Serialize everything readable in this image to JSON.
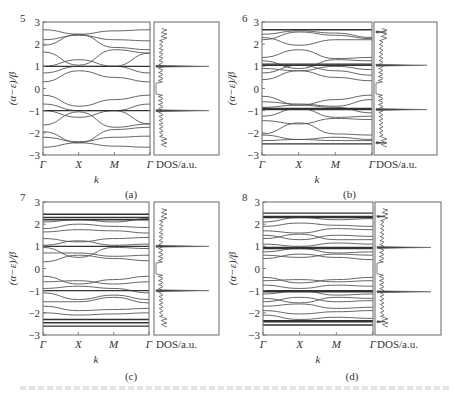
{
  "figure": {
    "panels": [
      {
        "id": "a",
        "number": "5",
        "caption": "(a)"
      },
      {
        "id": "b",
        "number": "6",
        "caption": "(b)"
      },
      {
        "id": "c",
        "number": "7",
        "caption": "(c)"
      },
      {
        "id": "d",
        "number": "8",
        "caption": "(d)"
      }
    ],
    "y_axis_label": "(α−ε)/β",
    "x_axis_label": "k",
    "x_ticks": [
      "Γ",
      "X",
      "M",
      "Γ"
    ],
    "y_ticks": [
      "3",
      "2",
      "1",
      "0",
      "−1",
      "−2",
      "−3"
    ],
    "dos_label": "DOS/a.u."
  },
  "chart_data": [
    {
      "type": "line",
      "title": "(a) N=5 band structure and DOS",
      "xlabel": "k",
      "ylabel": "(α−ε)/β",
      "x_ticks": [
        "Γ",
        "X",
        "M",
        "Γ"
      ],
      "ylim": [
        -3,
        3
      ],
      "flat_bands": [
        1,
        -1
      ],
      "bands_sampled_at_ticks": [
        [
          2.65,
          2.45,
          2.6,
          2.65
        ],
        [
          2.2,
          2.4,
          2.2,
          2.15
        ],
        [
          1.95,
          2.45,
          1.85,
          1.75
        ],
        [
          1.65,
          1.05,
          1.75,
          1.6
        ],
        [
          1.0,
          1.3,
          1.0,
          1.6
        ],
        [
          0.7,
          1.0,
          1.0,
          0.7
        ],
        [
          0.3,
          0.8,
          0.5,
          0.3
        ],
        [
          -0.3,
          -0.8,
          -0.5,
          -0.3
        ],
        [
          -0.7,
          -1.0,
          -1.0,
          -0.7
        ],
        [
          -1.0,
          -1.3,
          -1.0,
          -1.6
        ],
        [
          -1.65,
          -1.05,
          -1.75,
          -1.6
        ],
        [
          -1.95,
          -2.45,
          -1.85,
          -1.75
        ],
        [
          -2.2,
          -2.4,
          -2.2,
          -2.15
        ],
        [
          -2.65,
          -2.45,
          -2.6,
          -2.65
        ]
      ],
      "dos_peaks": [
        {
          "energy": 1.0,
          "height": 1.0
        },
        {
          "energy": -1.0,
          "height": 1.0
        }
      ]
    },
    {
      "type": "line",
      "title": "(b) N=6 band structure and DOS",
      "xlabel": "k",
      "ylabel": "(α−ε)/β",
      "x_ticks": [
        "Γ",
        "X",
        "M",
        "Γ"
      ],
      "ylim": [
        -3,
        3
      ],
      "flat_bands": [
        2.65,
        1.1,
        1.05,
        -0.9,
        -0.95,
        -2.5
      ],
      "bands_sampled_at_ticks": [
        [
          2.45,
          2.6,
          2.5,
          2.3
        ],
        [
          2.2,
          2.55,
          2.4,
          2.25
        ],
        [
          2.3,
          1.95,
          2.2,
          2.2
        ],
        [
          1.4,
          1.75,
          1.35,
          1.4
        ],
        [
          1.25,
          0.9,
          1.3,
          1.25
        ],
        [
          0.9,
          0.8,
          1.0,
          0.85
        ],
        [
          0.7,
          1.05,
          0.8,
          0.6
        ],
        [
          0.4,
          0.8,
          0.5,
          0.35
        ],
        [
          -0.35,
          -0.75,
          -0.5,
          -0.3
        ],
        [
          -0.6,
          -0.7,
          -0.8,
          -0.5
        ],
        [
          -0.85,
          -0.75,
          -0.85,
          -1.1
        ],
        [
          -1.25,
          -0.9,
          -1.3,
          -1.25
        ],
        [
          -1.45,
          -1.6,
          -1.35,
          -1.4
        ],
        [
          -2.05,
          -1.55,
          -2.05,
          -2.1
        ],
        [
          -2.1,
          -2.3,
          -2.2,
          -2.3
        ],
        [
          -2.35,
          -2.3,
          -2.35,
          -2.35
        ]
      ],
      "dos_peaks": [
        {
          "energy": 1.05,
          "height": 1.0
        },
        {
          "energy": -0.95,
          "height": 1.0
        },
        {
          "energy": 2.55,
          "height": 0.2
        },
        {
          "energy": -2.45,
          "height": 0.2
        }
      ]
    },
    {
      "type": "line",
      "title": "(c) N=7 band structure and DOS",
      "xlabel": "k",
      "ylabel": "(α−ε)/β",
      "x_ticks": [
        "Γ",
        "X",
        "M",
        "Γ"
      ],
      "ylim": [
        -3,
        3
      ],
      "flat_bands": [
        2.45,
        2.3,
        2.2,
        1.0,
        -1.0,
        -2.3,
        -2.45,
        -2.6
      ],
      "bands_sampled_at_ticks": [
        [
          2.1,
          2.2,
          2.1,
          2.25
        ],
        [
          1.8,
          2.0,
          1.9,
          1.85
        ],
        [
          1.65,
          1.75,
          1.7,
          1.6
        ],
        [
          1.35,
          1.2,
          1.35,
          1.4
        ],
        [
          1.05,
          1.25,
          1.05,
          1.1
        ],
        [
          0.95,
          0.5,
          0.95,
          0.9
        ],
        [
          0.7,
          0.7,
          0.55,
          0.6
        ],
        [
          0.3,
          0.6,
          0.45,
          0.35
        ],
        [
          -0.35,
          -0.7,
          -0.5,
          -0.35
        ],
        [
          -0.6,
          -0.55,
          -0.7,
          -0.6
        ],
        [
          -0.9,
          -0.8,
          -0.9,
          -1.1
        ],
        [
          -1.1,
          -1.4,
          -1.2,
          -1.4
        ],
        [
          -1.5,
          -1.5,
          -1.3,
          -1.55
        ],
        [
          -1.7,
          -1.9,
          -1.85,
          -1.8
        ],
        [
          -2.0,
          -2.1,
          -2.05,
          -2.0
        ]
      ],
      "dos_peaks": [
        {
          "energy": 1.0,
          "height": 1.0
        },
        {
          "energy": -1.0,
          "height": 1.0
        }
      ]
    },
    {
      "type": "line",
      "title": "(d) N=8 band structure and DOS",
      "xlabel": "k",
      "ylabel": "(α−ε)/β",
      "x_ticks": [
        "Γ",
        "X",
        "M",
        "Γ"
      ],
      "ylim": [
        -3,
        3
      ],
      "flat_bands": [
        2.5,
        2.35,
        2.3,
        0.95,
        0.9,
        -1.0,
        -1.05,
        -2.35,
        -2.4,
        -2.55
      ],
      "bands_sampled_at_ticks": [
        [
          2.1,
          2.3,
          2.2,
          2.25
        ],
        [
          1.9,
          2.05,
          1.95,
          1.9
        ],
        [
          1.7,
          1.6,
          1.8,
          1.75
        ],
        [
          1.5,
          1.3,
          1.5,
          1.45
        ],
        [
          1.35,
          1.55,
          1.3,
          1.3
        ],
        [
          1.1,
          1.0,
          1.15,
          1.1
        ],
        [
          0.75,
          0.9,
          0.7,
          0.75
        ],
        [
          0.6,
          0.5,
          0.65,
          0.6
        ],
        [
          0.45,
          0.65,
          0.5,
          0.4
        ],
        [
          -0.4,
          -0.65,
          -0.5,
          -0.4
        ],
        [
          -0.55,
          -0.5,
          -0.6,
          -0.55
        ],
        [
          -0.75,
          -0.9,
          -0.75,
          -0.8
        ],
        [
          -1.15,
          -1.0,
          -1.2,
          -1.15
        ],
        [
          -1.35,
          -1.55,
          -1.3,
          -1.35
        ],
        [
          -1.5,
          -1.3,
          -1.5,
          -1.45
        ],
        [
          -1.7,
          -1.6,
          -1.8,
          -1.75
        ],
        [
          -1.9,
          -2.05,
          -1.95,
          -1.9
        ],
        [
          -2.1,
          -2.3,
          -2.2,
          -2.25
        ]
      ],
      "dos_peaks": [
        {
          "energy": 0.95,
          "height": 1.0
        },
        {
          "energy": -1.05,
          "height": 1.0
        },
        {
          "energy": 2.35,
          "height": 0.15
        },
        {
          "energy": -2.4,
          "height": 0.15
        }
      ]
    }
  ],
  "layout": {
    "panels": [
      {
        "band": {
          "x0": 43,
          "x1": 150,
          "y0": 22,
          "y1": 155
        },
        "dos": {
          "x0": 154,
          "x1": 219
        },
        "num_xy": [
          20,
          22
        ],
        "k_y": 183,
        "cap_y": 198
      },
      {
        "band": {
          "x0": 262,
          "x1": 372,
          "y0": 22,
          "y1": 155
        },
        "dos": {
          "x0": 374,
          "x1": 437
        },
        "num_xy": [
          242,
          22
        ],
        "k_y": 183,
        "cap_y": 198
      },
      {
        "band": {
          "x0": 43,
          "x1": 149,
          "y0": 202,
          "y1": 335
        },
        "dos": {
          "x0": 154,
          "x1": 219
        },
        "num_xy": [
          20,
          201
        ],
        "k_y": 363,
        "cap_y": 380
      },
      {
        "band": {
          "x0": 263,
          "x1": 373,
          "y0": 202,
          "y1": 335
        },
        "dos": {
          "x0": 375,
          "x1": 441
        },
        "num_xy": [
          242,
          201
        ],
        "k_y": 363,
        "cap_y": 380
      }
    ],
    "line_color": "#555555",
    "frame_color": "#666666"
  }
}
